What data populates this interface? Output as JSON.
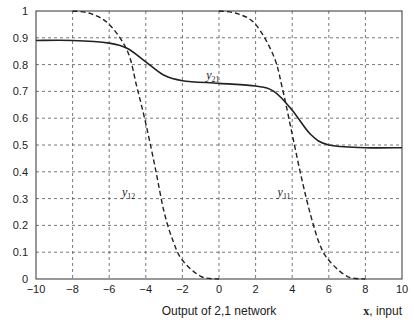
{
  "chart_data": {
    "type": "line",
    "title": "",
    "xlabel": "Output of 2,1 network",
    "xlabel_right_bold": "x",
    "xlabel_right_rest": ", input",
    "ylabel": "",
    "xlim": [
      -10,
      10
    ],
    "ylim": [
      0,
      1
    ],
    "grid": true,
    "x_ticks": [
      "-10",
      "-8",
      "-6",
      "-4",
      "-2",
      "0",
      "2",
      "4",
      "6",
      "8",
      "10"
    ],
    "y_ticks": [
      "0",
      "0.1",
      "0.2",
      "0.3",
      "0.4",
      "0.5",
      "0.6",
      "0.7",
      "0.8",
      "0.9",
      "1"
    ],
    "series": [
      {
        "name": "y21",
        "label_main": "y",
        "label_sub": "21",
        "style": "solid",
        "x": [
          -10,
          -8,
          -6,
          -5,
          -4,
          -3,
          -2,
          0,
          2,
          3,
          4,
          5,
          6,
          8,
          10
        ],
        "values": [
          0.89,
          0.89,
          0.88,
          0.86,
          0.81,
          0.76,
          0.74,
          0.73,
          0.72,
          0.7,
          0.63,
          0.54,
          0.5,
          0.49,
          0.49
        ]
      },
      {
        "name": "y12",
        "label_main": "y",
        "label_sub": "12",
        "style": "dashed",
        "x": [
          -8,
          -7,
          -6,
          -5,
          -4.5,
          -4,
          -3.5,
          -3,
          -2.5,
          -2,
          -1,
          0
        ],
        "values": [
          1.0,
          0.99,
          0.95,
          0.85,
          0.72,
          0.58,
          0.42,
          0.25,
          0.14,
          0.07,
          0.01,
          0.0
        ]
      },
      {
        "name": "y11",
        "label_main": "y",
        "label_sub": "11",
        "style": "dashed",
        "x": [
          0,
          1,
          2,
          3,
          3.5,
          4,
          4.5,
          5,
          5.5,
          6,
          7,
          8
        ],
        "values": [
          1.0,
          0.99,
          0.95,
          0.83,
          0.7,
          0.54,
          0.38,
          0.24,
          0.13,
          0.07,
          0.01,
          0.0
        ]
      }
    ],
    "annotations": [
      {
        "text": "y21",
        "x": -0.7,
        "y": 0.745
      },
      {
        "text": "y12",
        "x": -5.3,
        "y": 0.31
      },
      {
        "text": "y11",
        "x": 3.2,
        "y": 0.31
      }
    ]
  }
}
